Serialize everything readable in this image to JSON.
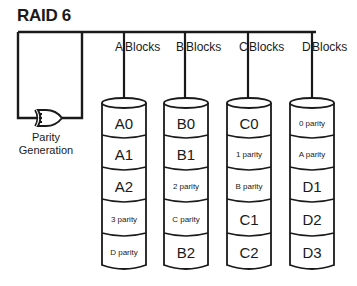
{
  "title": "RAID 6",
  "parity_generator": {
    "label_line1": "Parity",
    "label_line2": "Generation",
    "icon": "logic-gate-icon"
  },
  "columns": [
    {
      "letter": "A",
      "label": "Blocks",
      "blocks": [
        "A0",
        "A1",
        "A2",
        "3 parity",
        "D parity"
      ]
    },
    {
      "letter": "B",
      "label": "Blocks",
      "blocks": [
        "B0",
        "B1",
        "2 parity",
        "C parity",
        "B2"
      ]
    },
    {
      "letter": "C",
      "label": "Blocks",
      "blocks": [
        "C0",
        "1 parity",
        "B parity",
        "C1",
        "C2"
      ]
    },
    {
      "letter": "D",
      "label": "Blocks",
      "blocks": [
        "0 parity",
        "A parity",
        "D1",
        "D2",
        "D3"
      ]
    }
  ],
  "colors": {
    "line": "#1a1a1a",
    "background": "#ffffff"
  }
}
